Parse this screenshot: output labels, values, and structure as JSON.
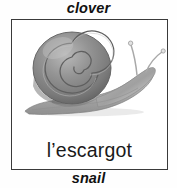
{
  "card": {
    "top_annotation": "clover",
    "bottom_annotation": "snail",
    "caption": "l’escargot",
    "illustration": {
      "subject": "snail",
      "style": "grayscale pencil drawing",
      "alt": "A grey garden snail with a spiral shell, extended foot and two raised tentacles"
    },
    "colors": {
      "background": "#ffffff",
      "frame_border": "#3a3a3a",
      "text": "#111111",
      "caption_text": "#1a1a1a",
      "shell_dark": "#6f6f6f",
      "shell_mid": "#8c8c8c",
      "shell_light": "#b4b4b4",
      "body_gray": "#a8a8a8",
      "body_light": "#cfcfcf"
    }
  }
}
